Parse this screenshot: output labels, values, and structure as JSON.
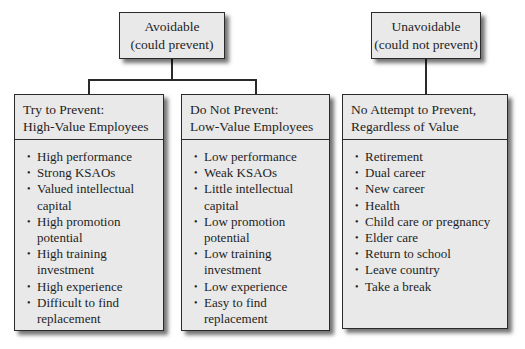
{
  "top_nodes": {
    "avoidable": {
      "line1": "Avoidable",
      "line2": "(could prevent)"
    },
    "unavoidable": {
      "line1": "Unavoidable",
      "line2": "(could not prevent)"
    }
  },
  "columns": [
    {
      "header_line1": "Try to Prevent:",
      "header_line2": "High-Value Employees",
      "items": [
        "High performance",
        "Strong KSAOs",
        "Valued intellectual capital",
        "High promotion potential",
        "High training investment",
        "High experience",
        "Difficult to find replacement"
      ]
    },
    {
      "header_line1": "Do Not Prevent:",
      "header_line2": "Low-Value Employees",
      "items": [
        "Low performance",
        "Weak KSAOs",
        "Little intellectual capital",
        "Low promotion potential",
        "Low training investment",
        "Low experience",
        "Easy to find replacement"
      ]
    },
    {
      "header_line1": "No Attempt to Prevent,",
      "header_line2": "Regardless of Value",
      "items": [
        "Retirement",
        "Dual career",
        "New career",
        "Health",
        "Child care or pregnancy",
        "Elder care",
        "Return to school",
        "Leave country",
        "Take a break"
      ]
    }
  ],
  "colors": {
    "box_fill": "#e9e9e9",
    "border": "#2a2a2a",
    "background": "#ffffff"
  }
}
